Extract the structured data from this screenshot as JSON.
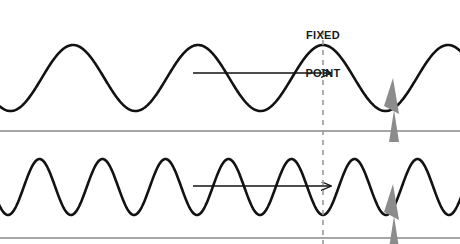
{
  "figure": {
    "title_line1": "FIXED",
    "title_line2": "POINT",
    "background_color": "#ffffff",
    "wave_color": "#121212",
    "arrow_color": "#121212",
    "divider_color": "#8a8a8a",
    "dashed_line_color": "#9a9a9a",
    "marker_color": "#8c8c8c",
    "label_color": "#1a1a1a"
  },
  "fixed_point": {
    "label_line1": "FIXED",
    "label_line2": "POINT",
    "x": 323,
    "line_style": "dashed",
    "line_top": 30,
    "line_bottom": 244
  },
  "panels": [
    {
      "name": "low-frequency-wave",
      "wavelength_px": 125,
      "amplitude_px": 33,
      "baseline_y": 78,
      "phase_at_fixed_point": "crest",
      "arrow": {
        "x_start": 193,
        "x_end": 331,
        "y": 73,
        "direction": "right"
      },
      "marker_x": 393
    },
    {
      "name": "high-frequency-wave",
      "wavelength_px": 63,
      "amplitude_px": 28,
      "baseline_y": 187,
      "phase_at_fixed_point": "trough",
      "arrow": {
        "x_start": 193,
        "x_end": 331,
        "y": 186,
        "direction": "right"
      },
      "marker_x": 393
    }
  ],
  "dividers": [
    {
      "name": "upper-divider",
      "y": 131
    },
    {
      "name": "lower-divider",
      "y": 238
    }
  ]
}
